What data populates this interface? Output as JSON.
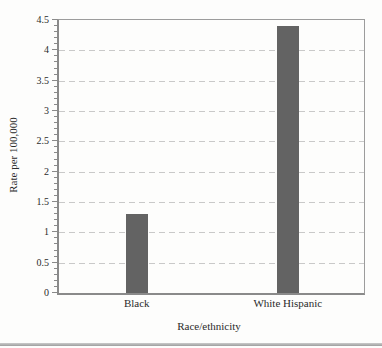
{
  "chart_data": {
    "type": "bar",
    "title": "",
    "categories": [
      "Black",
      "White Hispanic"
    ],
    "values": [
      1.3,
      4.4
    ],
    "xlabel": "Race/ethnicity",
    "ylabel": "Rate per 100,000",
    "ylim": [
      0,
      4.5
    ],
    "ytick_labels": [
      "0",
      "0.5",
      "1",
      "1.5",
      "2",
      "2.5",
      "3",
      "3.5",
      "4",
      "4.5"
    ],
    "ytick_step": 0.5,
    "minor_tick_step": 0.1,
    "grid": "horizontal dashed at each major tick",
    "legend_position": "none",
    "bar_color": "#636363",
    "grid_color": "#c9c9c9",
    "axis_color": "#8a8a8a",
    "text_color": "#2b2b2b"
  },
  "page": {
    "background": "#fdfdfc",
    "bottom_rule_color": "#9e9e9e"
  }
}
